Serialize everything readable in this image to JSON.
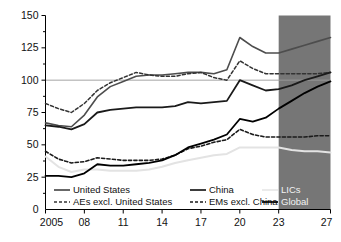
{
  "chart_data": {
    "type": "line",
    "title": "",
    "subtitle": "",
    "xlabel": "",
    "ylabel": "",
    "xlim": [
      2005,
      2027
    ],
    "ylim": [
      0,
      150
    ],
    "yticks": [
      0,
      25,
      50,
      75,
      100,
      125,
      150
    ],
    "ytick_labels": [
      "0",
      "25",
      "50",
      "75",
      "100",
      "125",
      "150"
    ],
    "yminor_ticks": [
      12.5,
      37.5,
      62.5,
      87.5,
      112.5,
      137.5
    ],
    "xticks": [
      2005,
      2008,
      2011,
      2014,
      2017,
      2020,
      2023,
      2027
    ],
    "xtick_labels": [
      "2005",
      "08",
      "11",
      "14",
      "17",
      "20",
      "23",
      "27"
    ],
    "grid": false,
    "reference_line": {
      "value": 100,
      "color": "#9a9a9a"
    },
    "forecast_shading": {
      "start": 2023,
      "end": 2027,
      "color": "#767676"
    },
    "legend_position": "bottom",
    "x": [
      2005,
      2006,
      2007,
      2008,
      2009,
      2010,
      2011,
      2012,
      2013,
      2014,
      2015,
      2016,
      2017,
      2018,
      2019,
      2020,
      2021,
      2022,
      2023,
      2024,
      2025,
      2026,
      2027
    ],
    "series": [
      {
        "name": "United States",
        "style": "solid",
        "color": "#4d4d4d",
        "width": 1.6,
        "values": [
          67,
          65,
          64,
          73,
          87,
          95,
          99,
          103,
          104,
          104,
          105,
          106,
          106,
          105,
          108,
          133,
          126,
          121,
          121,
          124,
          127,
          130,
          133
        ]
      },
      {
        "name": "AEs excl. United States",
        "style": "dashed",
        "color": "#333333",
        "width": 1.5,
        "values": [
          82,
          78,
          75,
          82,
          92,
          98,
          102,
          106,
          104,
          103,
          103,
          105,
          106,
          102,
          100,
          115,
          109,
          105,
          105,
          105,
          105,
          105,
          106
        ]
      },
      {
        "name": "China",
        "style": "solid",
        "color": "#1a1a1a",
        "width": 1.8,
        "values": [
          65,
          64,
          62,
          66,
          75,
          77,
          78,
          79,
          79,
          79,
          80,
          83,
          82,
          83,
          84,
          100,
          96,
          92,
          93,
          96,
          100,
          103,
          106
        ]
      },
      {
        "name": "EMs excl. China",
        "style": "dashed",
        "color": "#1a1a1a",
        "width": 1.6,
        "values": [
          45,
          39,
          36,
          37,
          40,
          39,
          38,
          38,
          38,
          39,
          42,
          47,
          49,
          52,
          54,
          62,
          58,
          56,
          56,
          56,
          56,
          57,
          57
        ]
      },
      {
        "name": "LICs",
        "style": "solid",
        "color": "#e3e3e3",
        "width": 2.0,
        "values": [
          41,
          33,
          29,
          31,
          31,
          30,
          30,
          30,
          31,
          33,
          36,
          38,
          40,
          42,
          43,
          48,
          48,
          48,
          48,
          46,
          45,
          45,
          44
        ]
      },
      {
        "name": "Global",
        "style": "solid",
        "color": "#000000",
        "width": 1.8,
        "values": [
          26,
          26,
          25,
          28,
          35,
          34,
          34,
          35,
          36,
          38,
          42,
          48,
          51,
          54,
          58,
          70,
          68,
          71,
          78,
          84,
          90,
          95,
          99
        ]
      }
    ]
  },
  "legend": {
    "items": [
      {
        "label": "United States",
        "style": "solid",
        "color": "#4d4d4d",
        "text_color": "dark"
      },
      {
        "label": "China",
        "style": "solid",
        "color": "#1a1a1a",
        "text_color": "dark"
      },
      {
        "label": "LICs",
        "style": "solid",
        "color": "#e8e8e8",
        "text_color": "light"
      },
      {
        "label": "AEs excl. United States",
        "style": "dashed",
        "color": "#333333",
        "text_color": "dark"
      },
      {
        "label": "EMs excl. China",
        "style": "dashed",
        "color": "#1a1a1a",
        "text_color": "dark"
      },
      {
        "label": "Global",
        "style": "solid",
        "color": "#000000",
        "text_color": "light"
      }
    ]
  }
}
